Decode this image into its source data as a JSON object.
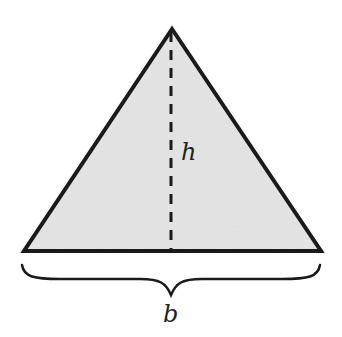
{
  "diagram": {
    "shape": "triangle",
    "fill_color": "#e6e6e6",
    "stroke_color": "#1a1a1a",
    "height_label": "h",
    "base_label": "b",
    "vertices": {
      "apex": [
        172,
        29
      ],
      "base_left": [
        24,
        251
      ],
      "base_right": [
        321,
        251
      ]
    }
  }
}
